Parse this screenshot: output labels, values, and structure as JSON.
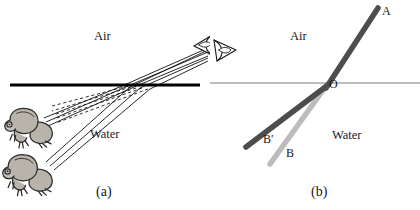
{
  "figure": {
    "width": 420,
    "height": 210,
    "background_color": "#ffffff"
  },
  "panels": [
    {
      "id": "a",
      "caption": "(a)",
      "caption_pos": {
        "x": 96,
        "y": 185
      },
      "media": [
        {
          "name": "air",
          "label": "Air",
          "x": 94,
          "y": 30
        },
        {
          "name": "water",
          "label": "Water",
          "x": 90,
          "y": 128
        }
      ],
      "interface": {
        "name": "water-surface-line",
        "x1": 10,
        "y1": 85,
        "x2": 200,
        "y2": 85,
        "color": "#000000",
        "thickness": 3.2
      },
      "objects": [
        {
          "name": "frog-upper",
          "label": "frog",
          "x": 4,
          "y": 104,
          "width": 52,
          "height": 46
        },
        {
          "name": "frog-lower",
          "label": "frog",
          "x": 2,
          "y": 150,
          "width": 54,
          "height": 48
        },
        {
          "name": "eye-observer",
          "label": "eye",
          "x": 192,
          "y": 32,
          "width": 24,
          "height": 24,
          "direction": "left"
        }
      ],
      "real_rays": {
        "name": "real-light-rays",
        "description": "solid rays from the two frogs refracting at the surface toward the eye",
        "color": "#111111",
        "count": 6
      },
      "virtual_rays": {
        "name": "virtual-image-rays",
        "description": "dashed backward extensions showing the apparent raised positions of the frogs",
        "color": "#333333",
        "style": "dashed",
        "count": 5
      }
    },
    {
      "id": "b",
      "caption": "(b)",
      "caption_pos": {
        "x": 101,
        "y": 185
      },
      "media": [
        {
          "name": "air",
          "label": "Air",
          "x": 80,
          "y": 30
        },
        {
          "name": "water",
          "label": "Water",
          "x": 122,
          "y": 129
        }
      ],
      "interface": {
        "name": "water-surface-line",
        "x1": 0,
        "y1": 83,
        "x2": 210,
        "y2": 83,
        "color": "#7d7d7d",
        "thickness": 1
      },
      "objects": [
        {
          "name": "eye-observer",
          "label": "eye",
          "x": 2,
          "y": 38,
          "width": 24,
          "height": 24,
          "direction": "right"
        }
      ],
      "rays": [
        {
          "name": "ray-incident-OA",
          "label": "A",
          "label_x": 172,
          "label_y": 5,
          "from": {
            "x": 116,
            "y": 86
          },
          "to": {
            "x": 168,
            "y": 8
          },
          "color": "#4d4d4d",
          "thickness": 5.5
        },
        {
          "name": "ray-apparent-OB-prime",
          "label": "B′",
          "label_x": 53,
          "label_y": 133,
          "from": {
            "x": 116,
            "y": 86
          },
          "to": {
            "x": 36,
            "y": 147
          },
          "color": "#4d4d4d",
          "thickness": 5.5
        },
        {
          "name": "ray-refracted-OB",
          "label": "B",
          "label_x": 76,
          "label_y": 147,
          "from": {
            "x": 116,
            "y": 86
          },
          "to": {
            "x": 60,
            "y": 164
          },
          "color": "#bcbcbc",
          "thickness": 5.5
        }
      ],
      "points": [
        {
          "name": "point-O",
          "label": "O",
          "x": 119,
          "y": 78
        }
      ]
    }
  ],
  "colors": {
    "ink": "#1a1a1a",
    "surface_line_a": "#000000",
    "surface_line_b": "#7d7d7d",
    "ray_dark": "#4d4d4d",
    "ray_light": "#bcbcbc",
    "frog_body": "#b8b3ab",
    "frog_outline": "#2b2b2b"
  }
}
